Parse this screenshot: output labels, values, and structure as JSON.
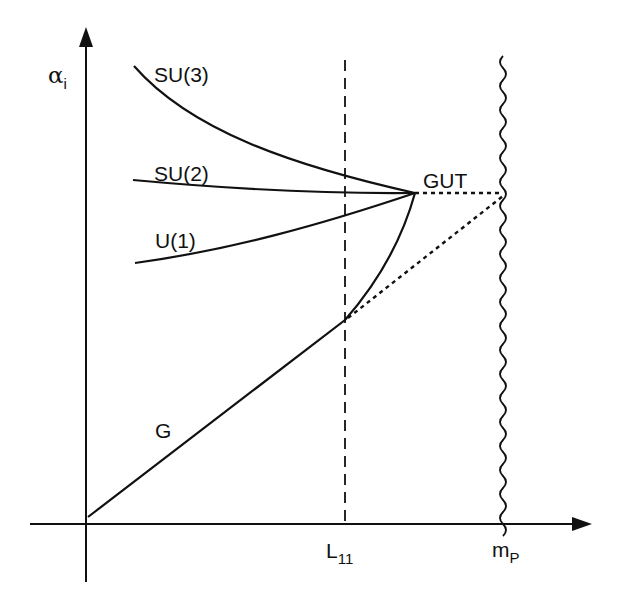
{
  "diagram": {
    "axes": {
      "y_label_symbol": "α",
      "y_label_sub": "i",
      "x_ticks": [
        {
          "id": "l11",
          "main": "L",
          "sub": "11"
        },
        {
          "id": "mp",
          "main": "m",
          "sub": "P"
        }
      ]
    },
    "curves": [
      {
        "id": "su3",
        "label": "SU(3)"
      },
      {
        "id": "su2",
        "label": "SU(2)"
      },
      {
        "id": "u1",
        "label": "U(1)"
      },
      {
        "id": "g",
        "label": "G"
      }
    ],
    "points": {
      "gut": {
        "label": "GUT"
      }
    },
    "line_styles": {
      "l11_line": "dashed",
      "planck_line": "wavy",
      "extrapolation": "dotted"
    },
    "colors": {
      "stroke": "#111111",
      "background": "#ffffff"
    }
  }
}
